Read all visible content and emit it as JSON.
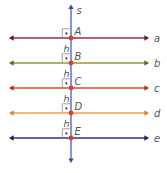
{
  "figure": {
    "background": "#ffffff",
    "width": 167,
    "height": 173,
    "text_color": "#54545c",
    "point_color": "#d8402b",
    "angle_mark": {
      "box_color": "#9aa0ad",
      "dot_color": "#3e3e46"
    },
    "transversal": {
      "label": "s",
      "color": "#5468bf",
      "arrow_color": "#3c4ba0"
    },
    "parallel_lines": [
      {
        "label": "a",
        "point": "A",
        "color": "#9e2746",
        "arrow_color": "#63162e"
      },
      {
        "label": "b",
        "point": "B",
        "color": "#97972c",
        "arrow_color": "#63631a"
      },
      {
        "label": "c",
        "point": "C",
        "color": "#e54428",
        "arrow_color": "#b02f18"
      },
      {
        "label": "d",
        "point": "D",
        "color": "#f49c42",
        "arrow_color": "#e07f28"
      },
      {
        "label": "e",
        "point": "E",
        "color": "#2f3689",
        "arrow_color": "#1b2057"
      }
    ],
    "gap_labels": [
      "h",
      "h",
      "h",
      "h"
    ],
    "layout": {
      "line_y": [
        38,
        63,
        88,
        113,
        138
      ],
      "transversal_x": 71,
      "line_x1": 9,
      "line_x2": 149,
      "label_x": 154,
      "transversal_y1": 4.5,
      "transversal_y2": 163
    }
  }
}
